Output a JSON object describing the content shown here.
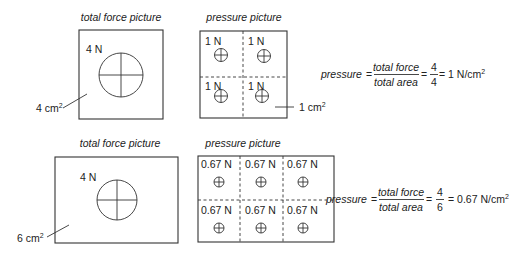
{
  "top": {
    "total_force": {
      "caption": "total force picture",
      "force_label": "4 N",
      "area_label": "4 cm",
      "area_sup": "2"
    },
    "pressure": {
      "caption": "pressure picture",
      "cells": [
        "1 N",
        "1 N",
        "1 N",
        "1 N"
      ],
      "cell_area_label": "1 cm",
      "cell_area_sup": "2"
    },
    "equation": {
      "lhs": "pressure",
      "eq1": "=",
      "num": "total force",
      "den": "total area",
      "eq2": "=",
      "val_num": "4",
      "val_den": "4",
      "eq3": "= 1 N/cm",
      "sup": "2"
    }
  },
  "bottom": {
    "total_force": {
      "caption": "total force picture",
      "force_label": "4 N",
      "area_label": "6 cm",
      "area_sup": "2"
    },
    "pressure": {
      "caption": "pressure picture",
      "cells": [
        "0.67 N",
        "0.67 N",
        "0.67 N",
        "0.67 N",
        "0.67 N",
        "0.67 N"
      ]
    },
    "equation": {
      "lhs": "pressure",
      "eq1": "=",
      "num": "total force",
      "den": "total area",
      "eq2": "=",
      "val_num": "4",
      "val_den": "6",
      "eq3": "= 0.67 N/cm",
      "sup": "2"
    }
  }
}
